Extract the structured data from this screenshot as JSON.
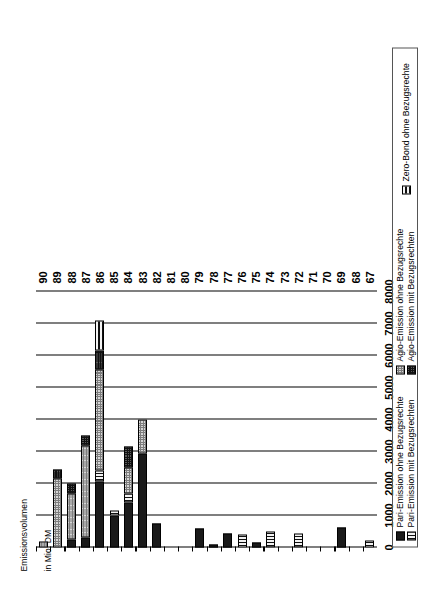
{
  "chart_data": {
    "type": "bar",
    "orientation": "horizontal",
    "title": "",
    "ylabel": "Emissionsvolumen\nin Mio. DM",
    "xlabel": "",
    "ylim": [
      0,
      8000
    ],
    "value_ticks": [
      "0",
      "1000",
      "2000",
      "3000",
      "4000",
      "5000",
      "6000",
      "7000",
      "8000"
    ],
    "value_tick_numbers": [
      0,
      1000,
      2000,
      3000,
      4000,
      5000,
      6000,
      7000,
      8000
    ],
    "grid": true,
    "categories": [
      "67",
      "68",
      "69",
      "70",
      "71",
      "72",
      "73",
      "74",
      "75",
      "76",
      "77",
      "78",
      "79",
      "80",
      "81",
      "82",
      "83",
      "84",
      "85",
      "86",
      "87",
      "88",
      "89",
      "90"
    ],
    "legend_position": "bottom",
    "series": [
      {
        "name": "Pari-Emission ohne Bezugsrechte",
        "pattern": "solid-black",
        "values": [
          0,
          0,
          620,
          0,
          0,
          0,
          0,
          0,
          150,
          0,
          450,
          80,
          600,
          0,
          0,
          760,
          2950,
          1400,
          1000,
          2050,
          300,
          250,
          0,
          0
        ]
      },
      {
        "name": "Pari-Emission mit Bezugsrechten",
        "pattern": "vertical-lines",
        "values": [
          210,
          0,
          0,
          0,
          0,
          450,
          0,
          500,
          0,
          400,
          0,
          0,
          0,
          0,
          0,
          0,
          0,
          300,
          150,
          350,
          0,
          0,
          0,
          0
        ]
      },
      {
        "name": "Agio-Emission ohne Bezugsrechte",
        "pattern": "light-checker",
        "values": [
          0,
          0,
          0,
          0,
          0,
          0,
          0,
          0,
          0,
          0,
          0,
          0,
          0,
          0,
          0,
          0,
          1050,
          800,
          0,
          3150,
          2900,
          1450,
          2150,
          200
        ]
      },
      {
        "name": "Agio-Emission mit Bezugsrechten",
        "pattern": "dark-checker",
        "values": [
          0,
          0,
          0,
          0,
          0,
          0,
          0,
          0,
          0,
          0,
          0,
          0,
          0,
          0,
          0,
          0,
          0,
          650,
          0,
          600,
          300,
          300,
          300,
          0
        ]
      },
      {
        "name": "Zero-Bond ohne Bezugsrechte",
        "pattern": "horizontal-lines",
        "values": [
          0,
          0,
          0,
          0,
          0,
          0,
          0,
          0,
          0,
          0,
          0,
          0,
          0,
          0,
          0,
          0,
          0,
          0,
          0,
          950,
          0,
          0,
          0,
          0
        ]
      }
    ]
  },
  "legend": {
    "items": [
      {
        "label": "Pari-Emission ohne Bezugsrechte",
        "pattern": "solid-black"
      },
      {
        "label": "Pari-Emission mit Bezugsrechten",
        "pattern": "vertical-lines"
      },
      {
        "label": "Agio-Emission ohne Bezugsrechte",
        "pattern": "light-checker"
      },
      {
        "label": "Agio-Emission mit Bezugsrechten",
        "pattern": "dark-checker"
      },
      {
        "label": "Zero-Bond ohne Bezugsrechte",
        "pattern": "horizontal-lines"
      }
    ]
  },
  "axis_title": {
    "line1": "Emissionsvolumen",
    "line2": "in Mio. DM"
  },
  "colors": {
    "ink": "#000000",
    "paper": "#ffffff",
    "series_solid": "#1a1a1a",
    "series_light": "#d6d6d6",
    "series_dark": "#5a5a5a"
  }
}
